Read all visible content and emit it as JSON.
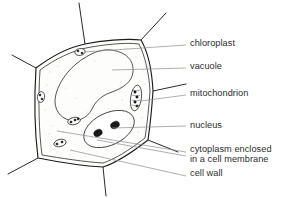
{
  "figure": {
    "background_color": "#ffffff",
    "line_color": "#1c1c1c",
    "leader_color": "#8d8d8d",
    "text_color": "#2d2d2d"
  },
  "labels": [
    {
      "id": "chloroplast",
      "text": "chloroplast",
      "x": 190,
      "y": 42
    },
    {
      "id": "vacuole",
      "text": "vacuole",
      "x": 190,
      "y": 66
    },
    {
      "id": "mitochondrion",
      "text": "mitochondrion",
      "x": 190,
      "y": 92
    },
    {
      "id": "nucleus",
      "text": "nucleus",
      "x": 190,
      "y": 124
    },
    {
      "id": "cytoplasm",
      "text": "cytoplasm enclosed\nin a cell membrane",
      "x": 190,
      "y": 150
    },
    {
      "id": "cell-wall",
      "text": "cell wall",
      "x": 190,
      "y": 173
    }
  ],
  "structures": [
    {
      "id": "cell-wall",
      "name": "cell wall"
    },
    {
      "id": "cell-membrane",
      "name": "cell membrane"
    },
    {
      "id": "cytoplasm",
      "name": "cytoplasm"
    },
    {
      "id": "vacuole",
      "name": "vacuole"
    },
    {
      "id": "nucleus",
      "name": "nucleus"
    },
    {
      "id": "nucleolus",
      "name": "nucleolus"
    },
    {
      "id": "mitochondrion",
      "name": "mitochondrion"
    },
    {
      "id": "chloroplast",
      "name": "chloroplast"
    }
  ]
}
